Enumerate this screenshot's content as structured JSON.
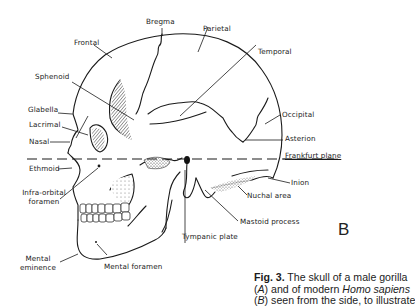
{
  "figure": {
    "panel_letter": "B",
    "labels": {
      "bregma": "Bregma",
      "parietal": "Parietal",
      "frontal": "Frontal",
      "temporal": "Temporal",
      "sphenoid": "Sphenoid",
      "glabella": "Glabella",
      "lacrimal": "Lacrimal",
      "nasal": "Nasal",
      "occipital": "Occipital",
      "asterion": "Asterion",
      "frankfurt_plane": "Frankfurt plane",
      "ethmoid": "Ethmoid",
      "inion": "Inion",
      "infra_orbital_1": "Infra-orbital",
      "infra_orbital_2": "foramen",
      "nuchal_area": "Nuchal area",
      "mastoid_process": "Mastoid process",
      "tympanic_plate": "Tympanic plate",
      "mental_eminence_1": "Mental",
      "mental_eminence_2": "eminence",
      "mental_foramen": "Mental foramen"
    },
    "caption": {
      "fig_label": "Fig. 3.",
      "line1_rest": " The skull of a male gorilla",
      "line2_a": "(",
      "line2_A": "A",
      "line2_b": ") and of modern ",
      "line2_species": "Homo sapiens",
      "line3_a": "(",
      "line3_B": "B",
      "line3_b": ") seen from the side, to illustrate"
    }
  }
}
